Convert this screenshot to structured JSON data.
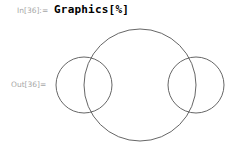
{
  "input": {
    "label": "In[36]:=",
    "code": "Graphics[%]"
  },
  "output": {
    "label": "Out[36]=",
    "graphic": {
      "type": "circles",
      "stroke_color": "#555555",
      "circles": [
        {
          "name": "big-circle",
          "cx": 140,
          "cy": 85,
          "r": 56
        },
        {
          "name": "left-circle",
          "cx": 84,
          "cy": 85,
          "r": 28
        },
        {
          "name": "right-circle",
          "cx": 196,
          "cy": 85,
          "r": 28
        }
      ]
    }
  }
}
